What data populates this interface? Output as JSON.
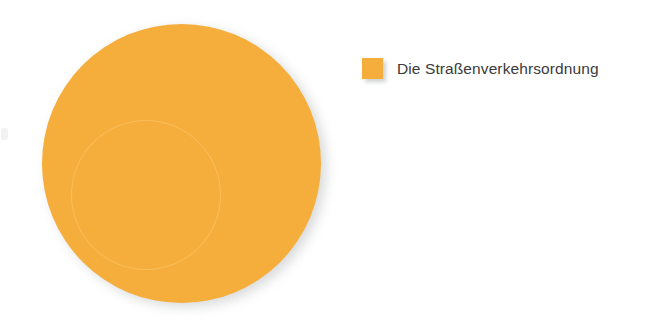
{
  "chart_data": {
    "type": "pie",
    "title": "",
    "subtitle": "",
    "xlabel": "",
    "ylabel": "",
    "grid": false,
    "legend_position": "right",
    "categories": [
      "Die Straßenverkehrsordnung"
    ],
    "values": [
      100
    ],
    "units": "percent",
    "slices": [
      {
        "label": "Die Straßenverkehrsordnung",
        "value": 100,
        "color": "#f5ae3c"
      }
    ],
    "annotations": []
  },
  "legend": {
    "entries": [
      {
        "label": "Die Straßenverkehrsordnung",
        "swatch_color": "#f5ae3c"
      }
    ]
  },
  "colors": {
    "background": "#ffffff",
    "slice_orange": "#f5ae3c",
    "text": "#3a3a3c",
    "shadow": "#b9bbbd"
  }
}
